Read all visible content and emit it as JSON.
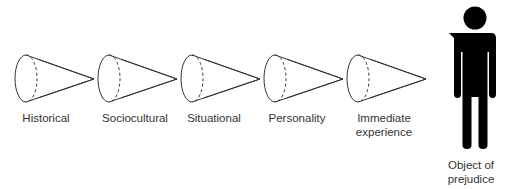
{
  "diagram": {
    "stages": [
      {
        "label": "Historical"
      },
      {
        "label": "Sociocultural"
      },
      {
        "label": "Situational"
      },
      {
        "label": "Personality"
      },
      {
        "label": "Immediate experience",
        "line1": "Immediate",
        "line2": "experience"
      }
    ],
    "target": {
      "line1": "Object of",
      "line2": "prejudice",
      "icon": "person-icon"
    },
    "colors": {
      "stroke": "#333333",
      "figure": "#000000",
      "text": "#333333"
    }
  }
}
